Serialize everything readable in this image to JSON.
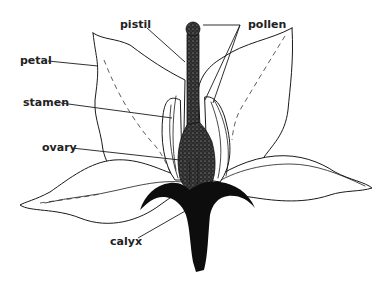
{
  "diagram": {
    "colors": {
      "background": "#ffffff",
      "ink": "#1a1a1a",
      "stipple": "#3a3a3a",
      "calyx": "#0d0d0d"
    },
    "labels": [
      {
        "id": "pistil",
        "text": "pistil",
        "x": 120,
        "y": 28
      },
      {
        "id": "pollen",
        "text": "pollen",
        "x": 248,
        "y": 28
      },
      {
        "id": "petal",
        "text": "petal",
        "x": 20,
        "y": 64
      },
      {
        "id": "stamen",
        "text": "stamen",
        "x": 23,
        "y": 106
      },
      {
        "id": "ovary",
        "text": "ovary",
        "x": 42,
        "y": 151
      },
      {
        "id": "calyx",
        "text": "calyx",
        "x": 110,
        "y": 245
      }
    ],
    "leaders": [
      {
        "id": "pistil-leader",
        "points": "147,28 185,62"
      },
      {
        "id": "pollen-leader-a",
        "points": "203,25 240,25 205,100"
      },
      {
        "id": "pollen-leader-b",
        "points": "240,25 213,103"
      },
      {
        "id": "petal-leader",
        "points": "48,61 98,66"
      },
      {
        "id": "stamen-leader",
        "points": "61,103 172,118"
      },
      {
        "id": "ovary-leader",
        "points": "72,148 180,160"
      },
      {
        "id": "calyx-leader",
        "points": "138,238 187,210"
      }
    ]
  }
}
